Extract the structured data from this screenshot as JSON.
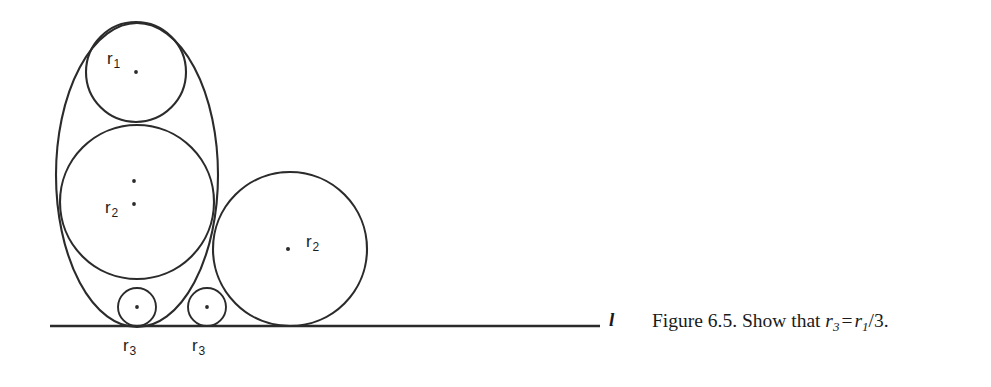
{
  "figure": {
    "caption_prefix": "Figure 6.5. Show that ",
    "caption_full": "Figure 6.5. Show that r3 = r1/3.",
    "line_label": "l",
    "formula": {
      "lhs_var": "r",
      "lhs_sub": "3",
      "equals": "=",
      "rhs_var": "r",
      "rhs_sub": "1",
      "rhs_rest": "/3."
    },
    "labels": {
      "r1": {
        "var": "r",
        "sub": "1"
      },
      "r2_left": {
        "var": "r",
        "sub": "2"
      },
      "r2_right": {
        "var": "r",
        "sub": "2"
      },
      "r3_left": {
        "var": "r",
        "sub": "3"
      },
      "r3_right": {
        "var": "r",
        "sub": "3"
      }
    },
    "colors": {
      "stroke": "#2b2b2b",
      "background": "#ffffff",
      "text": "#1a1a1a"
    },
    "geometry": {
      "baseline_y": 326,
      "baseline_x_start": 50,
      "baseline_x_end": 600,
      "outer_oval": {
        "cx": 137,
        "cy": 175,
        "rx": 81,
        "ry": 152
      },
      "circle_r1": {
        "cx": 136,
        "cy": 72,
        "r": 50
      },
      "circle_r2_left": {
        "cx": 137,
        "cy": 202,
        "r": 77
      },
      "circle_r2_right": {
        "cx": 290,
        "cy": 249,
        "r": 77
      },
      "circle_r3_left": {
        "cx": 137,
        "cy": 307,
        "r": 19
      },
      "circle_r3_right": {
        "cx": 207,
        "cy": 307,
        "r": 19
      }
    }
  }
}
